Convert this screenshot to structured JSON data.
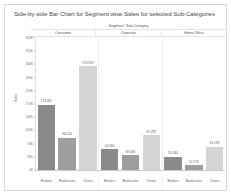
{
  "viz": {
    "title": "Side-by-side Bar Chart for Segment wise Sales for selected Sub-Categories",
    "header_super": "Segment / Sub-Category",
    "segments": [
      "Consumer",
      "Corporate",
      "Home Office"
    ]
  },
  "chart_data": {
    "type": "bar",
    "title": "Side-by-side Bar Chart for Segment wise Sales for selected Sub-Categories",
    "xlabel": "Segment / Sub-Category",
    "ylabel": "Sales",
    "grid": false,
    "legend": "none",
    "ylim": [
      0,
      350000
    ],
    "ytick_values": [
      0,
      35000,
      70000,
      105000,
      140000,
      175000,
      210000,
      245000,
      280000,
      315000,
      350000
    ],
    "ytick_labels": [
      "0K",
      "35K",
      "70K",
      "105K",
      "140K",
      "175K",
      "210K",
      "245K",
      "280K",
      "315K",
      "350K"
    ],
    "groups": [
      "Consumer",
      "Corporate",
      "Home Office"
    ],
    "categories": [
      "Binders",
      "Bookcases",
      "Chairs"
    ],
    "colors": {
      "Binders": "#8a8a8a",
      "Bookcases": "#9e9e9e",
      "Chairs": "#d4d4d4",
      "accent": "#8a8a8a"
    },
    "bars": [
      {
        "group": "Consumer",
        "category": "Binders",
        "value": 173461,
        "label": "173,461",
        "color": "#8a8a8a"
      },
      {
        "group": "Consumer",
        "category": "Bookcases",
        "value": 86114,
        "label": "86,114",
        "color": "#9e9e9e"
      },
      {
        "group": "Consumer",
        "category": "Chairs",
        "value": 274929,
        "label": "274,929",
        "color": "#d4d4d4"
      },
      {
        "group": "Corporate",
        "category": "Binders",
        "value": 54580,
        "label": "54,580",
        "color": "#8a8a8a"
      },
      {
        "group": "Corporate",
        "category": "Bookcases",
        "value": 39080,
        "label": "39,080",
        "color": "#9e9e9e"
      },
      {
        "group": "Corporate",
        "category": "Chairs",
        "value": 92787,
        "label": "92,787",
        "color": "#d4d4d4"
      },
      {
        "group": "Home Office",
        "category": "Binders",
        "value": 35180,
        "label": "35,180",
        "color": "#8a8a8a"
      },
      {
        "group": "Home Office",
        "category": "Bookcases",
        "value": 12276,
        "label": "12,276",
        "color": "#9e9e9e"
      },
      {
        "group": "Home Office",
        "category": "Chairs",
        "value": 61185,
        "label": "61,185",
        "color": "#d4d4d4"
      }
    ]
  }
}
